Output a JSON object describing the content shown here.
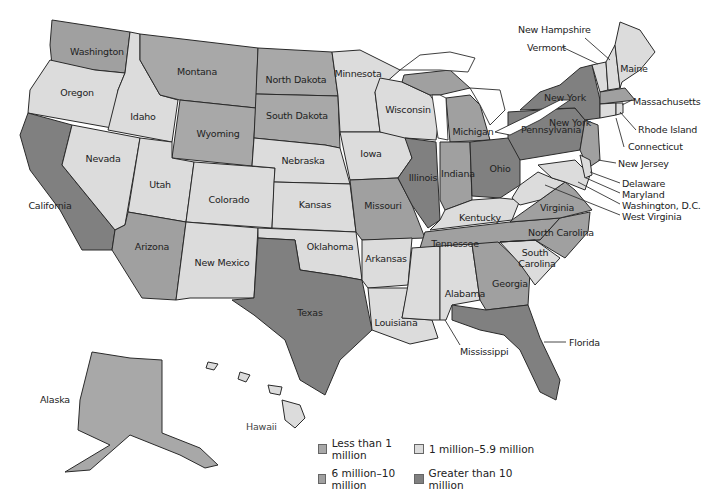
{
  "colors": {
    "lt1m": "#a8a8a8",
    "m1to59": "#dcdcdc",
    "m6to10": "#a0a0a0",
    "gt10m": "#808080"
  },
  "legend": [
    {
      "key": "lt1m",
      "label": "Less than 1 million",
      "color": "#a8a8a8"
    },
    {
      "key": "m1to59",
      "label": "1 million–5.9 million",
      "color": "#dcdcdc"
    },
    {
      "key": "m6to10",
      "label": "6 million–10 million",
      "color": "#a0a0a0"
    },
    {
      "key": "gt10m",
      "label": "Greater than 10 million",
      "color": "#808080"
    }
  ],
  "states": {
    "washington": "Washington",
    "oregon": "Oregon",
    "california": "California",
    "idaho": "Idaho",
    "nevada": "Nevada",
    "montana": "Montana",
    "wyoming": "Wyoming",
    "utah": "Utah",
    "arizona": "Arizona",
    "colorado": "Colorado",
    "new_mexico": "New Mexico",
    "north_dakota": "North Dakota",
    "south_dakota": "South Dakota",
    "nebraska": "Nebraska",
    "kansas": "Kansas",
    "oklahoma": "Oklahoma",
    "texas": "Texas",
    "minnesota": "Minnesota",
    "iowa": "Iowa",
    "missouri": "Missouri",
    "arkansas": "Arkansas",
    "louisiana": "Louisiana",
    "wisconsin": "Wisconsin",
    "illinois": "Illinois",
    "michigan": "Michigan",
    "indiana": "Indiana",
    "ohio": "Ohio",
    "kentucky": "Kentucky",
    "tennessee": "Tennessee",
    "mississippi": "Mississippi",
    "alabama": "Alabama",
    "georgia": "Georgia",
    "florida": "Florida",
    "south_carolina_1": "South",
    "south_carolina_2": "Carolina",
    "north_carolina": "North Carolina",
    "virginia": "Virginia",
    "west_virginia": "West Virginia",
    "pennsylvania": "Pennsylvania",
    "new_york": "New York",
    "new_jersey": "New Jersey",
    "delaware": "Delaware",
    "maryland": "Maryland",
    "washington_dc": "Washington, D.C.",
    "connecticut": "Connecticut",
    "rhode_island": "Rhode Island",
    "massachusetts": "Massachusetts",
    "vermont": "Vermont",
    "new_hampshire": "New Hampshire",
    "maine": "Maine",
    "alaska": "Alaska",
    "hawaii": "Hawaii"
  },
  "state_categories": {
    "lt1m": [
      "Montana",
      "Wyoming",
      "North Dakota",
      "South Dakota",
      "Alaska",
      "Vermont",
      "Delaware",
      "Washington, D.C."
    ],
    "m1to59": [
      "Oregon",
      "Idaho",
      "Nevada",
      "Utah",
      "Colorado",
      "New Mexico",
      "Nebraska",
      "Kansas",
      "Oklahoma",
      "Minnesota",
      "Iowa",
      "Arkansas",
      "Louisiana",
      "Wisconsin",
      "Kentucky",
      "Mississippi",
      "Alabama",
      "South Carolina",
      "West Virginia",
      "Maine",
      "New Hampshire",
      "Connecticut",
      "Rhode Island",
      "Hawaii",
      "Maryland"
    ],
    "m6to10": [
      "Washington",
      "Arizona",
      "Missouri",
      "Michigan",
      "Indiana",
      "Tennessee",
      "Georgia",
      "North Carolina",
      "Virginia",
      "New Jersey",
      "Massachusetts"
    ],
    "gt10m": [
      "California",
      "Texas",
      "Illinois",
      "Ohio",
      "Pennsylvania",
      "New York",
      "Florida"
    ]
  }
}
